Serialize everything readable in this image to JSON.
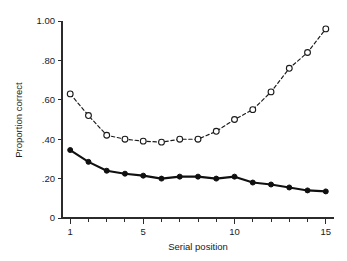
{
  "chart_data": {
    "type": "line",
    "title": "",
    "xlabel": "Serial position",
    "ylabel": "Proportion correct",
    "x": [
      1,
      2,
      3,
      4,
      5,
      6,
      7,
      8,
      9,
      10,
      11,
      12,
      13,
      14,
      15
    ],
    "xlim": [
      0.55,
      15.45
    ],
    "ylim": [
      0,
      1.0
    ],
    "grid": false,
    "legend": "none",
    "xticks": [
      1,
      2,
      3,
      4,
      5,
      6,
      7,
      8,
      9,
      10,
      11,
      12,
      13,
      14,
      15
    ],
    "xtick_labels": [
      "1",
      "",
      "",
      "",
      "5",
      "",
      "",
      "",
      "",
      "10",
      "",
      "",
      "",
      "",
      "15"
    ],
    "yticks": [
      0,
      0.2,
      0.4,
      0.6,
      0.8,
      1.0
    ],
    "ytick_labels": [
      "0",
      ".20",
      ".40",
      ".60",
      ".80",
      "1.00"
    ],
    "series": [
      {
        "name": "open-circle-series",
        "marker": "open-circle",
        "linestyle": "dashed",
        "values": [
          0.63,
          0.52,
          0.42,
          0.4,
          0.39,
          0.385,
          0.4,
          0.4,
          0.44,
          0.5,
          0.55,
          0.64,
          0.76,
          0.84,
          0.96
        ]
      },
      {
        "name": "filled-circle-series",
        "marker": "filled-circle",
        "linestyle": "solid",
        "values": [
          0.345,
          0.285,
          0.24,
          0.225,
          0.215,
          0.2,
          0.21,
          0.21,
          0.2,
          0.21,
          0.18,
          0.17,
          0.155,
          0.14,
          0.135
        ]
      }
    ]
  },
  "colors": {
    "axis": "#2b2b2b",
    "series_open": "#1a1a1a",
    "series_filled": "#101010",
    "background": "#ffffff"
  }
}
